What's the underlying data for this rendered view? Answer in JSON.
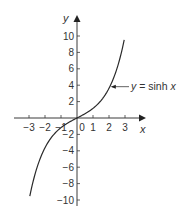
{
  "chart_data": {
    "type": "line",
    "title": "",
    "xlabel": "x",
    "ylabel": "y",
    "xlim": [
      -3.5,
      3.5
    ],
    "ylim": [
      -11,
      11.5
    ],
    "grid": false,
    "legend": null,
    "x_ticks": [
      -3,
      -2,
      -1,
      0,
      1,
      2,
      3
    ],
    "x_tick_labels": [
      "−3",
      "−2",
      "−1",
      "0",
      "1",
      "2",
      "3"
    ],
    "y_ticks": [
      10,
      8,
      6,
      4,
      2,
      -2,
      -4,
      -6,
      -8,
      -10
    ],
    "y_tick_labels": [
      "10",
      "8",
      "6",
      "4",
      "2",
      "−2",
      "−4",
      "−6",
      "−8",
      "−10"
    ],
    "series": [
      {
        "name": "y = sinh x",
        "function": "sinh",
        "x": [
          -3,
          -2.5,
          -2,
          -1.5,
          -1,
          -0.5,
          0,
          0.5,
          1,
          1.5,
          2,
          2.5,
          3
        ],
        "y": [
          -10.02,
          -6.05,
          -3.63,
          -2.13,
          -1.18,
          -0.52,
          0,
          0.52,
          1.18,
          2.13,
          3.63,
          6.05,
          10.02
        ]
      }
    ],
    "annotations": [
      {
        "text": "y = sinh x",
        "points_to_x": 2.05,
        "points_to_y": 3.8
      }
    ]
  },
  "labels": {
    "x_axis": "x",
    "y_axis": "y",
    "curve_label_y": "y",
    "curve_label_eq": " = sinh ",
    "curve_label_x": "x"
  }
}
